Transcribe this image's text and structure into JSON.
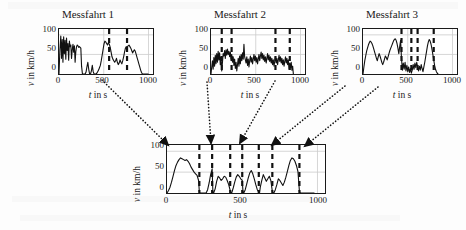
{
  "figure": {
    "background": "#fdfdfd",
    "ink": "#111111",
    "axis_color": "#1a1a1a",
    "grid_color": "#cccccc"
  },
  "axis_labels": {
    "y_var": "v",
    "y_rest": " in km/h",
    "x_var": "t",
    "x_rest": " in s"
  },
  "ticks": {
    "y": [
      "0",
      "50",
      "100"
    ],
    "x": [
      "0",
      "500",
      "1000"
    ]
  },
  "panels": [
    {
      "id": "messfahrt-1",
      "title": "Messfahrt 1",
      "ylabel": "v in km/h",
      "xlabel": "t in s"
    },
    {
      "id": "messfahrt-2",
      "title": "Messfahrt 2",
      "ylabel": "v in km/h",
      "xlabel": "t in s"
    },
    {
      "id": "messfahrt-3",
      "title": "Messfahrt 3",
      "ylabel": "v in km/h",
      "xlabel": "t in s"
    },
    {
      "id": "combined",
      "title": "",
      "ylabel": "v in km/h",
      "xlabel": "t in s"
    }
  ],
  "chart_data": [
    {
      "id": "messfahrt-1",
      "type": "line",
      "title": "Messfahrt 1",
      "xlabel": "t in s",
      "ylabel": "v in km/h",
      "xlim": [
        0,
        1050
      ],
      "ylim": [
        0,
        115
      ],
      "xticks": [
        0,
        500,
        1000
      ],
      "yticks": [
        0,
        50,
        100
      ],
      "grid": true,
      "markers": [
        560,
        760
      ],
      "x": [
        0,
        10,
        20,
        28,
        36,
        44,
        52,
        60,
        68,
        76,
        84,
        92,
        100,
        108,
        116,
        124,
        132,
        140,
        148,
        156,
        164,
        172,
        180,
        188,
        196,
        204,
        212,
        220,
        228,
        236,
        244,
        252,
        262,
        272,
        282,
        292,
        302,
        312,
        322,
        332,
        342,
        352,
        362,
        372,
        382,
        392,
        402,
        412,
        422,
        432,
        442,
        452,
        462,
        472,
        482,
        492,
        502,
        512,
        522,
        532,
        542,
        552,
        562,
        572,
        582,
        592,
        602,
        612,
        622,
        632,
        642,
        652,
        662,
        672,
        682,
        692,
        702,
        712,
        722,
        732,
        742,
        752,
        762,
        772,
        782,
        792,
        802,
        812,
        822,
        832,
        842,
        852,
        862,
        872,
        882,
        892,
        902,
        912,
        922,
        932,
        942,
        952,
        962,
        972,
        982,
        992,
        1000
      ],
      "y": [
        0,
        62,
        97,
        40,
        88,
        30,
        95,
        52,
        86,
        38,
        92,
        60,
        78,
        35,
        84,
        70,
        74,
        40,
        62,
        76,
        56,
        72,
        30,
        58,
        70,
        74,
        72,
        68,
        70,
        68,
        66,
        20,
        0,
        0,
        0,
        0,
        5,
        18,
        30,
        12,
        0,
        0,
        8,
        22,
        6,
        0,
        0,
        0,
        2,
        6,
        10,
        16,
        22,
        34,
        48,
        62,
        76,
        84,
        82,
        78,
        74,
        80,
        76,
        68,
        56,
        44,
        38,
        34,
        30,
        34,
        40,
        30,
        24,
        28,
        36,
        30,
        26,
        34,
        44,
        56,
        66,
        70,
        68,
        72,
        74,
        70,
        66,
        60,
        54,
        58,
        62,
        58,
        50,
        42,
        34,
        26,
        18,
        10,
        4,
        0,
        0,
        0,
        0,
        0,
        0,
        0,
        0
      ]
    },
    {
      "id": "messfahrt-2",
      "type": "line",
      "title": "Messfahrt 2",
      "xlabel": "t in s",
      "ylabel": "v in km/h",
      "xlim": [
        0,
        1050
      ],
      "ylim": [
        0,
        115
      ],
      "xticks": [
        0,
        500,
        1000
      ],
      "yticks": [
        0,
        50,
        100
      ],
      "grid": true,
      "markers": [
        120,
        230,
        720,
        880
      ],
      "x": [
        0,
        8,
        16,
        24,
        32,
        40,
        48,
        56,
        64,
        72,
        80,
        88,
        96,
        104,
        112,
        120,
        128,
        136,
        144,
        152,
        160,
        168,
        176,
        184,
        192,
        200,
        208,
        216,
        224,
        232,
        240,
        248,
        256,
        264,
        272,
        280,
        288,
        296,
        304,
        312,
        320,
        328,
        336,
        344,
        352,
        360,
        368,
        376,
        384,
        392,
        400,
        408,
        416,
        424,
        432,
        440,
        448,
        456,
        464,
        472,
        480,
        488,
        496,
        504,
        512,
        520,
        528,
        536,
        544,
        552,
        560,
        568,
        576,
        584,
        592,
        600,
        608,
        616,
        624,
        632,
        640,
        648,
        656,
        664,
        672,
        680,
        688,
        696,
        704,
        712,
        720,
        728,
        736,
        744,
        752,
        760,
        768,
        776,
        784,
        792,
        800,
        808,
        816,
        824,
        832,
        840,
        848,
        856,
        864,
        872,
        880,
        888,
        896,
        904,
        912,
        920
      ],
      "y": [
        0,
        18,
        34,
        12,
        42,
        20,
        48,
        26,
        52,
        30,
        58,
        36,
        54,
        24,
        44,
        8,
        30,
        52,
        46,
        60,
        40,
        62,
        48,
        64,
        50,
        58,
        44,
        56,
        38,
        50,
        30,
        44,
        22,
        38,
        14,
        30,
        8,
        24,
        40,
        20,
        46,
        26,
        50,
        34,
        54,
        38,
        76,
        44,
        36,
        28,
        44,
        22,
        38,
        18,
        34,
        46,
        30,
        42,
        26,
        38,
        50,
        34,
        46,
        30,
        42,
        26,
        38,
        50,
        34,
        46,
        56,
        40,
        52,
        36,
        48,
        32,
        44,
        28,
        40,
        52,
        36,
        48,
        32,
        44,
        28,
        40,
        24,
        36,
        20,
        32,
        44,
        28,
        40,
        24,
        36,
        48,
        32,
        44,
        28,
        40,
        24,
        36,
        20,
        32,
        44,
        28,
        40,
        24,
        36,
        12,
        28,
        16,
        30,
        10,
        20,
        0
      ]
    },
    {
      "id": "messfahrt-3",
      "type": "line",
      "title": "Messfahrt 3",
      "xlabel": "t in s",
      "ylabel": "v in km/h",
      "xlim": [
        0,
        1050
      ],
      "ylim": [
        0,
        115
      ],
      "xticks": [
        0,
        500,
        1000
      ],
      "yticks": [
        0,
        50,
        100
      ],
      "grid": true,
      "markers": [
        430,
        540,
        610,
        790
      ],
      "x": [
        0,
        10,
        20,
        30,
        40,
        50,
        60,
        70,
        80,
        90,
        100,
        110,
        120,
        130,
        140,
        150,
        160,
        170,
        180,
        190,
        200,
        210,
        220,
        230,
        240,
        250,
        260,
        270,
        280,
        290,
        300,
        310,
        320,
        330,
        340,
        350,
        360,
        370,
        380,
        390,
        400,
        410,
        420,
        430,
        440,
        450,
        460,
        470,
        480,
        490,
        500,
        510,
        520,
        530,
        540,
        550,
        560,
        570,
        580,
        590,
        600,
        610,
        620,
        630,
        640,
        650,
        660,
        670,
        680,
        690,
        700,
        710,
        720,
        730,
        740,
        750,
        760,
        770,
        780,
        790,
        800,
        810,
        820,
        830,
        840
      ],
      "y": [
        0,
        18,
        34,
        46,
        58,
        66,
        74,
        80,
        84,
        82,
        78,
        72,
        64,
        56,
        48,
        40,
        34,
        44,
        52,
        46,
        38,
        30,
        24,
        30,
        38,
        46,
        42,
        36,
        44,
        52,
        60,
        66,
        72,
        78,
        84,
        88,
        90,
        86,
        78,
        66,
        52,
        70,
        86,
        40,
        10,
        28,
        12,
        30,
        8,
        22,
        6,
        18,
        4,
        14,
        2,
        10,
        24,
        12,
        28,
        16,
        30,
        18,
        8,
        20,
        10,
        24,
        14,
        6,
        18,
        30,
        44,
        58,
        72,
        82,
        88,
        84,
        76,
        64,
        50,
        36,
        22,
        12,
        6,
        2,
        0
      ]
    },
    {
      "id": "combined",
      "type": "line",
      "title": "",
      "xlabel": "t in s",
      "ylabel": "v in km/h",
      "xlim": [
        0,
        1050
      ],
      "ylim": [
        0,
        115
      ],
      "xticks": [
        0,
        500,
        1000
      ],
      "yticks": [
        0,
        50,
        100
      ],
      "grid": true,
      "markers": [
        215,
        300,
        420,
        500,
        610,
        700,
        880
      ],
      "x": [
        0,
        10,
        20,
        30,
        40,
        50,
        60,
        70,
        80,
        90,
        100,
        110,
        120,
        130,
        140,
        150,
        160,
        170,
        180,
        190,
        200,
        210,
        215,
        220,
        230,
        240,
        250,
        260,
        270,
        280,
        290,
        300,
        305,
        310,
        320,
        330,
        340,
        350,
        360,
        370,
        380,
        390,
        400,
        410,
        420,
        425,
        430,
        440,
        450,
        460,
        470,
        480,
        490,
        500,
        505,
        510,
        520,
        530,
        540,
        550,
        560,
        570,
        580,
        590,
        600,
        610,
        615,
        620,
        630,
        640,
        650,
        660,
        670,
        680,
        690,
        700,
        705,
        710,
        720,
        730,
        740,
        750,
        760,
        770,
        780,
        790,
        800,
        810,
        820,
        830,
        840,
        850,
        860,
        870,
        880,
        885,
        890,
        900,
        910,
        920,
        930,
        940,
        950,
        960,
        970,
        980
      ],
      "y": [
        0,
        6,
        14,
        26,
        40,
        54,
        66,
        74,
        80,
        84,
        82,
        80,
        78,
        80,
        76,
        70,
        62,
        56,
        50,
        46,
        42,
        30,
        2,
        0,
        0,
        0,
        0,
        0,
        8,
        24,
        44,
        58,
        2,
        0,
        10,
        28,
        40,
        36,
        30,
        34,
        40,
        38,
        30,
        20,
        6,
        0,
        0,
        12,
        26,
        38,
        44,
        40,
        34,
        30,
        4,
        0,
        8,
        22,
        36,
        48,
        54,
        46,
        34,
        20,
        8,
        2,
        0,
        14,
        30,
        44,
        36,
        28,
        34,
        40,
        30,
        4,
        0,
        0,
        8,
        20,
        34,
        30,
        24,
        18,
        26,
        38,
        52,
        66,
        78,
        84,
        82,
        76,
        66,
        52,
        4,
        0,
        0,
        0,
        0,
        0,
        0,
        0,
        0,
        0,
        0,
        0
      ]
    }
  ],
  "connectors": [
    {
      "id": "arrow-1",
      "from_panel": "messfahrt-1",
      "to_panel": "combined"
    },
    {
      "id": "arrow-2",
      "from_panel": "messfahrt-2",
      "to_panel": "combined"
    },
    {
      "id": "arrow-3",
      "from_panel": "messfahrt-2",
      "to_panel": "combined"
    },
    {
      "id": "arrow-4",
      "from_panel": "messfahrt-3",
      "to_panel": "combined"
    },
    {
      "id": "arrow-5",
      "from_panel": "messfahrt-3",
      "to_panel": "combined"
    }
  ]
}
